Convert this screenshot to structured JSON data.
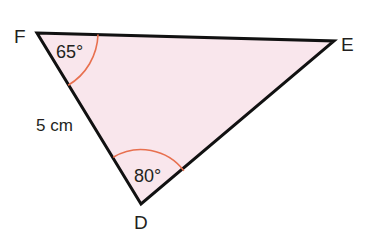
{
  "diagram": {
    "type": "triangle",
    "vertices": [
      {
        "name": "F",
        "x": 37,
        "y": 33
      },
      {
        "name": "E",
        "x": 334,
        "y": 41
      },
      {
        "name": "D",
        "x": 141,
        "y": 204
      }
    ],
    "angles": [
      {
        "vertex": "F",
        "label": "65°"
      },
      {
        "vertex": "D",
        "label": "80°"
      }
    ],
    "sides": [
      {
        "between": "F-D",
        "label": "5 cm"
      }
    ],
    "colors": {
      "fill": "#f9e6ec",
      "stroke": "#111111",
      "arc": "#e8704f",
      "text": "#231f20"
    }
  }
}
